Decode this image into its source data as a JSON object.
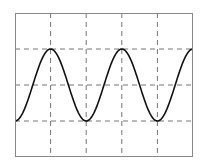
{
  "chart_data": {
    "type": "line",
    "title": "",
    "xlabel": "",
    "ylabel": "",
    "grid": true,
    "grid_style": "dashed",
    "legend": null,
    "x_divisions": 5,
    "y_divisions": 4,
    "xlim": [
      0,
      5
    ],
    "ylim": [
      -2,
      2
    ],
    "series": [
      {
        "name": "waveform",
        "function": "-cos(2*pi*x/2)",
        "description": "Sinusoid starting at trough (y=-1), period = 2 divisions, amplitude = 1 division",
        "x": [
          0,
          0.5,
          1,
          1.5,
          2,
          2.5,
          3,
          3.5,
          4,
          4.5,
          5
        ],
        "values": [
          -1,
          0,
          1,
          0,
          -1,
          0,
          1,
          0,
          -1,
          0,
          1
        ]
      }
    ],
    "colors": {
      "frame": "#888888",
      "grid": "#777777",
      "line": "#111111",
      "background": "#ffffff"
    }
  }
}
